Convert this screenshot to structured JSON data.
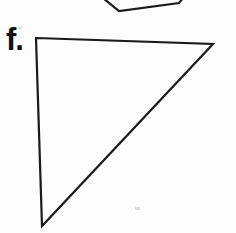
{
  "figure": {
    "label": "f.",
    "ink_color": "#1a1a1a",
    "paper_color": "#fdfdfd",
    "triangle": {
      "description": "large right-leaning triangle, apex bottom-left",
      "points": "36,38 213,44 42,226"
    },
    "partial_shape": {
      "description": "bottom vertex of an adjacent polygon cut off by the top edge",
      "points": "103,-2 119,11 179,3 184,-3"
    },
    "artifacts": [
      {
        "x": 18,
        "y": 27,
        "w": 4,
        "h": 2
      },
      {
        "x": 135,
        "y": 207,
        "w": 5,
        "h": 3
      }
    ]
  }
}
